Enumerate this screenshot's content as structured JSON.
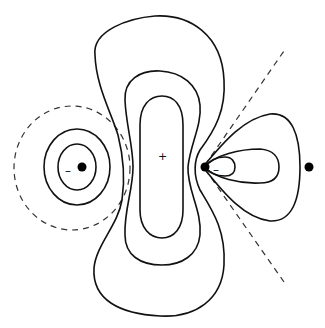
{
  "diagram": {
    "title": "",
    "colors": {
      "line": "#111111",
      "dashed": "#333333",
      "atom": "#000000",
      "background": "#ffffff"
    },
    "atoms": [
      {
        "id": "left",
        "x": 82,
        "y": 167
      },
      {
        "id": "center",
        "x": 205,
        "y": 167
      },
      {
        "id": "right",
        "x": 309,
        "y": 167
      }
    ],
    "labels": {
      "center_lobe_sign": "+",
      "left_lobe_sign": "–",
      "right_lobe_sign": "–"
    },
    "nodal_lines": {
      "left_circle": "dashed circle",
      "right_cone": "dashed lines from center atom"
    }
  }
}
